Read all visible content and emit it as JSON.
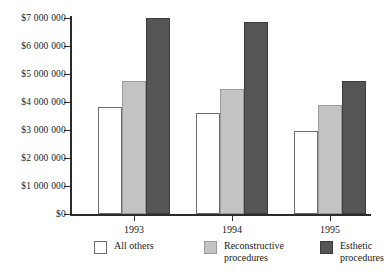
{
  "chart_data": {
    "type": "bar",
    "title": "",
    "subtitle": "",
    "xlabel": "",
    "ylabel": "",
    "categories": [
      "1993",
      "1994",
      "1995"
    ],
    "series": [
      {
        "name": "All others",
        "color": "#ffffff",
        "values": [
          3830000,
          3600000,
          2950000
        ]
      },
      {
        "name": "Reconstructive procedures",
        "color": "#c3c3c3",
        "values": [
          4750000,
          4450000,
          3900000
        ]
      },
      {
        "name": "Esthetic procedures",
        "color": "#555555",
        "values": [
          7000000,
          6850000,
          4750000
        ]
      }
    ],
    "ylim": [
      0,
      7000000
    ],
    "ytick_values": [
      0,
      1000000,
      2000000,
      3000000,
      4000000,
      5000000,
      6000000,
      7000000
    ],
    "ytick_labels": [
      "$0",
      "$1 000 000",
      "$2 000 000",
      "$3 000 000",
      "$4 000 000",
      "$5 000 000",
      "$6 000 000",
      "$7 000 000"
    ],
    "grid": false,
    "legend_position": "bottom",
    "legend_entries": [
      {
        "label": "All others",
        "lines": [
          "All others"
        ]
      },
      {
        "label": "Reconstructive procedures",
        "lines": [
          "Reconstructive",
          "procedures"
        ]
      },
      {
        "label": "Esthetic procedures",
        "lines": [
          "Esthetic",
          "procedures"
        ]
      }
    ]
  },
  "axis": {
    "axis_color": "#2b2b2b"
  }
}
